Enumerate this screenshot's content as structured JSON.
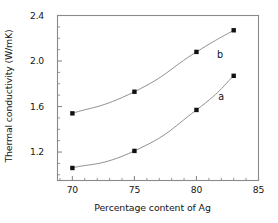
{
  "chart_data": {
    "type": "line",
    "title": "",
    "xlabel": "Percentage content of Ag",
    "ylabel": "Thermal conductivity (W/mK)",
    "xlim": [
      68.8,
      85.0
    ],
    "ylim": [
      0.95,
      2.4
    ],
    "xticks": [
      70,
      75,
      80,
      85
    ],
    "xticklabels": [
      "70",
      "75",
      "80",
      "85"
    ],
    "yticks": [
      1.2,
      1.6,
      2.0,
      2.4
    ],
    "yticklabels": [
      "1.2",
      "1.6",
      "2.0",
      "2.4"
    ],
    "minor_ticks": true,
    "grid": false,
    "legend": "inline-labels",
    "marker": "filled-square",
    "marker_color": "#111111",
    "line_color": "#8a8a8a",
    "frame_color": "#8a8a8a",
    "x": [
      70,
      75,
      80,
      83
    ],
    "series": [
      {
        "name": "a",
        "label": "a",
        "values": [
          1.06,
          1.21,
          1.57,
          1.87
        ],
        "label_position": {
          "x": 82.0,
          "y": 1.68
        }
      },
      {
        "name": "b",
        "label": "b",
        "values": [
          1.54,
          1.73,
          2.08,
          2.27
        ],
        "label_position": {
          "x": 81.9,
          "y": 2.05
        }
      }
    ]
  },
  "axes": {
    "ylabel_text": "Thermal conductivity (W/mK)",
    "xlabel_text": "Percentage content of Ag"
  }
}
